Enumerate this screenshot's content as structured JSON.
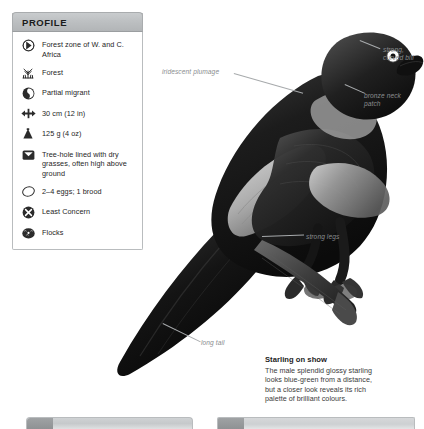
{
  "profile": {
    "header_label": "PROFILE",
    "rows": [
      {
        "icon": "distribution-globe-icon",
        "text": "Forest zone of W. and C. Africa"
      },
      {
        "icon": "habitat-forest-icon",
        "text": "Forest"
      },
      {
        "icon": "migration-partial-icon",
        "text": "Partial migrant"
      },
      {
        "icon": "length-arrows-icon",
        "text": "30 cm (12 in)"
      },
      {
        "icon": "weight-icon",
        "text": "125 g (4 oz)"
      },
      {
        "icon": "nest-icon",
        "text": "Tree-hole lined with dry grasses, often high above ground"
      },
      {
        "icon": "egg-icon",
        "text": "2–4 eggs; 1 brood"
      },
      {
        "icon": "conservation-status-icon",
        "text": "Least Concern"
      },
      {
        "icon": "social-flocks-icon",
        "text": "Flocks"
      }
    ]
  },
  "annotations": {
    "iridescent": "iridescent plumage",
    "bill_line1": "strong,",
    "bill_line2": "curved bill",
    "bronze_line1": "bronze neck",
    "bronze_line2": "patch",
    "legs": "strong legs",
    "tail": "long tail"
  },
  "caption": {
    "title": "Starling on show",
    "line1": "The male splendid glossy starling",
    "line2": "looks blue-green from a distance,",
    "line3": "but a closer look reveals its rich",
    "line4": "palette of brilliant colours."
  },
  "image": {
    "subject": "splendid-glossy-starling-photograph",
    "alt": "Black-and-white photograph of a splendid glossy starling perched on a branch"
  },
  "colors": {
    "panel_border": "#b9bcbe",
    "panel_header": "#bdc0c2",
    "annotation_text": "#8a8d8f",
    "body_text": "#262626"
  }
}
